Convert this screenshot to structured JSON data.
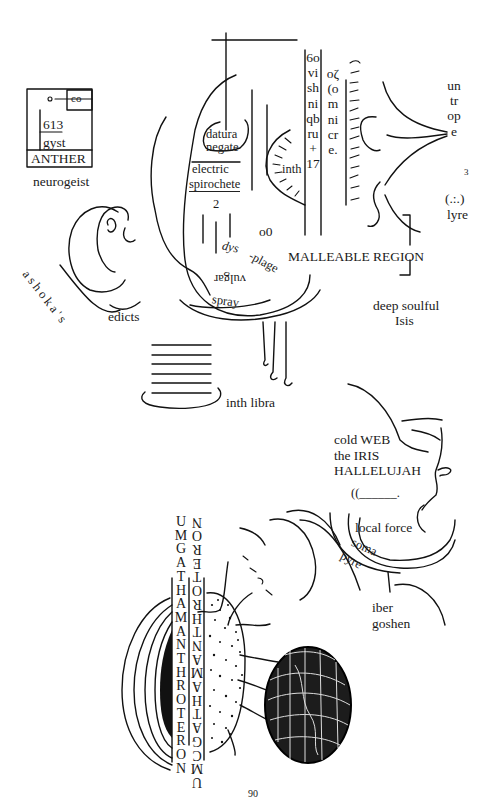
{
  "artwork": {
    "description": "Hand-drawn surrealist diagram page with organic line shapes and scattered labels",
    "colors": {
      "ink": "#111111",
      "paper": "#ffffff"
    }
  },
  "anther_box": {
    "corner_label": "co",
    "number": "613",
    "word": "gyst",
    "footer": "ANTHER",
    "caption": "neurogeist"
  },
  "upper_center": {
    "datura": "datura",
    "negate": "negate",
    "electric": "electric",
    "spirochete": "spirochete",
    "two": "2",
    "o0": "o0",
    "inth": "inth",
    "dys": "dys",
    "plage": "-plage",
    "vulgar": "vulgar",
    "spray": "spray"
  },
  "vertical_columns": {
    "col1": "6ovishniqbru+17",
    "col2": "oζ(omnicre.",
    "right": "untrope",
    "right_sup": "3",
    "right_tail": "(.:.)",
    "lyre": "lyre"
  },
  "labels": {
    "malleable": "MALLEABLE REGION",
    "deep_soulful": "deep soulful",
    "isis": "Isis",
    "ashokas": "ashoka's",
    "edicts": "edicts",
    "inth_libra": "inth libra"
  },
  "lower_right": {
    "cold_web": "cold WEB",
    "the_iris": "the IRIS",
    "hallelujah": "HALLELUJAH",
    "blank": "((______.",
    "local_force": "local force",
    "soma": "soma",
    "pyre": "pyre",
    "iber": "iber",
    "goshen": "goshen"
  },
  "lower_columns": {
    "left": "UMGATHAMANTHROTERON",
    "right_inverted": "UMCGATHAMANTHROTERON"
  },
  "page_number": "90"
}
